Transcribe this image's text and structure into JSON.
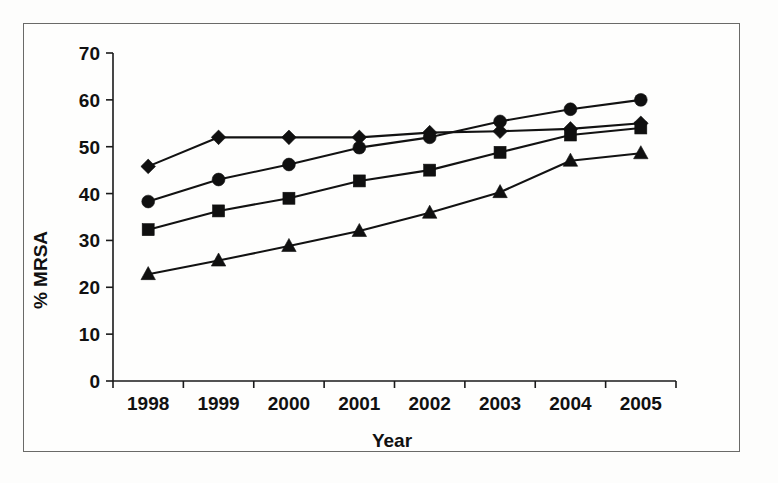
{
  "figure": {
    "border_color": "#6a6a68",
    "background": "#fefefd",
    "ink_color": "#111111"
  },
  "axes": {
    "y_title": "% MRSA",
    "x_title": "Year",
    "y_ticks": [
      "0",
      "10",
      "20",
      "30",
      "40",
      "50",
      "60",
      "70"
    ],
    "x_ticks": [
      "1998",
      "1999",
      "2000",
      "2001",
      "2002",
      "2003",
      "2004",
      "2005"
    ]
  },
  "chart_data": {
    "type": "line",
    "title": "",
    "subtitle": "",
    "xlabel": "Year",
    "ylabel": "% MRSA",
    "categories": [
      "1998",
      "1999",
      "2000",
      "2001",
      "2002",
      "2003",
      "2004",
      "2005"
    ],
    "x": [
      1998,
      1999,
      2000,
      2001,
      2002,
      2003,
      2004,
      2005
    ],
    "xlim": [
      1997.6,
      2005.4
    ],
    "ylim": [
      0,
      70
    ],
    "y_tick_values": [
      0,
      10,
      20,
      30,
      40,
      50,
      60,
      70
    ],
    "grid": false,
    "legend": false,
    "legend_position": "none",
    "series": [
      {
        "name": "series-diamond",
        "marker": "diamond",
        "color": "#101010",
        "values": [
          45.8,
          52.0,
          52.0,
          52.0,
          53.0,
          53.3,
          53.8,
          55.0
        ]
      },
      {
        "name": "series-circle",
        "marker": "circle",
        "color": "#101010",
        "values": [
          38.3,
          43.0,
          46.2,
          49.8,
          52.0,
          55.4,
          58.0,
          60.0
        ]
      },
      {
        "name": "series-square",
        "marker": "square",
        "color": "#101010",
        "values": [
          32.3,
          36.3,
          39.0,
          42.7,
          45.0,
          48.8,
          52.5,
          54.0
        ]
      },
      {
        "name": "series-triangle",
        "marker": "triangle",
        "color": "#101010",
        "values": [
          22.8,
          25.7,
          28.8,
          32.0,
          35.9,
          40.3,
          47.0,
          48.6
        ]
      }
    ]
  }
}
